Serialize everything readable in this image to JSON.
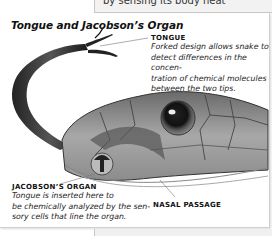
{
  "top_snippet": "by sensing its body heat",
  "figure": {
    "title": "Tongue and Jacobson’s Organ",
    "labels": {
      "tongue": {
        "heading": "TONGUE",
        "lines": [
          "Forked design allows snake to",
          "detect differences in the concen-",
          "tration of chemical molecules",
          "between the two tips."
        ]
      },
      "jacobson": {
        "heading": "JACOBSON’S ORGAN",
        "lines": [
          "Tongue is inserted here to",
          "be chemically analyzed by the sen-",
          "sory cells that line the organ."
        ]
      },
      "nasal": {
        "heading": "NASAL PASSAGE"
      }
    },
    "illustration": "snake-head-with-forked-tongue"
  },
  "colors": {
    "text": "#111111",
    "panel_border": "#d0d0d0",
    "strip_bg": "#f2f2f2"
  }
}
